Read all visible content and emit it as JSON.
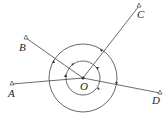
{
  "diagram": {
    "center": {
      "label": "O",
      "x": 83,
      "y": 78
    },
    "points": [
      {
        "label": "A",
        "x": 12,
        "y": 84,
        "lx": 7,
        "ly": 87
      },
      {
        "label": "B",
        "x": 26,
        "y": 38,
        "lx": 19,
        "ly": 43
      },
      {
        "label": "C",
        "x": 139,
        "y": 6,
        "lx": 138,
        "ly": 9
      },
      {
        "label": "D",
        "x": 160,
        "y": 93,
        "lx": 151,
        "ly": 95
      }
    ],
    "circles": [
      {
        "r": 34
      },
      {
        "r": 17
      }
    ],
    "colors": {
      "stroke": "#444444",
      "text": "#222222"
    }
  }
}
